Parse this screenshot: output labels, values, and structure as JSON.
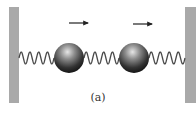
{
  "diagram": {
    "type": "coupled-oscillator",
    "caption": "(a)",
    "colors": {
      "wall": "#a9a9a9",
      "spring": "#4a4a4a",
      "mass_dark": "#1e1e1e",
      "mass_light": "#d8d8d8",
      "arrow": "#222222",
      "background": "#ffffff"
    },
    "walls": [
      {
        "side": "left",
        "x": 9,
        "y": 7,
        "width": 10,
        "height": 96
      },
      {
        "side": "right",
        "x": 185,
        "y": 7,
        "width": 11,
        "height": 96
      }
    ],
    "masses": [
      {
        "label": "mass-1",
        "cx": 69,
        "cy": 58,
        "r": 15
      },
      {
        "label": "mass-2",
        "cx": 134,
        "cy": 58,
        "r": 15
      }
    ],
    "springs": [
      {
        "label": "spring-left",
        "x1": 19,
        "x2": 54,
        "coils": 4
      },
      {
        "label": "spring-middle",
        "x1": 84,
        "x2": 119,
        "coils": 4
      },
      {
        "label": "spring-right",
        "x1": 149,
        "x2": 185,
        "coils": 4
      }
    ],
    "arrows": [
      {
        "label": "velocity-arrow-1",
        "direction": "right",
        "x1": 69,
        "x2": 88,
        "y": 23
      },
      {
        "label": "velocity-arrow-2",
        "direction": "right",
        "x1": 133,
        "x2": 152,
        "y": 24
      }
    ]
  }
}
